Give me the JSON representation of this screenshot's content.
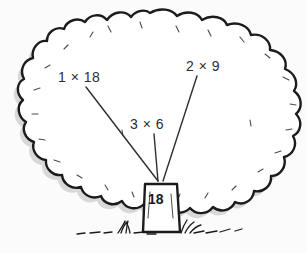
{
  "figure": {
    "name": "factor-tree-of-18",
    "background_color": "#fbfbfb",
    "ink_color": "#1b1b1b",
    "shadow_color": "#d4d4d4",
    "canopy_fill": "#ffffff",
    "trunk_fill": "#ffffff"
  },
  "labels": {
    "factor_pair_left": "1 × 18",
    "factor_pair_right": "2 × 9",
    "factor_pair_middle": "3 × 6",
    "product": "18"
  },
  "parts": {
    "canopy": "tree-canopy",
    "trunk": "tree-trunk",
    "grass": "grass-tufts",
    "pointer_left": "pointer-line-1x18",
    "pointer_middle": "pointer-line-3x6",
    "pointer_right": "pointer-line-2x9"
  }
}
